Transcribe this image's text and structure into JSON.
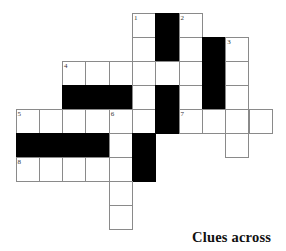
{
  "puzzle": {
    "grid": {
      "origin_x": 15.5,
      "origin_y": 13,
      "cell_w": 23.3,
      "cell_h": 24,
      "cells": [
        {
          "r": 0,
          "c": 5,
          "t": "w",
          "n": "1"
        },
        {
          "r": 0,
          "c": 6,
          "t": "b"
        },
        {
          "r": 0,
          "c": 7,
          "t": "w",
          "n": "2"
        },
        {
          "r": 1,
          "c": 5,
          "t": "w"
        },
        {
          "r": 1,
          "c": 6,
          "t": "b"
        },
        {
          "r": 1,
          "c": 7,
          "t": "w"
        },
        {
          "r": 1,
          "c": 8,
          "t": "b"
        },
        {
          "r": 1,
          "c": 9,
          "t": "w",
          "n": "3"
        },
        {
          "r": 2,
          "c": 2,
          "t": "w",
          "n": "4"
        },
        {
          "r": 2,
          "c": 3,
          "t": "w"
        },
        {
          "r": 2,
          "c": 4,
          "t": "w"
        },
        {
          "r": 2,
          "c": 5,
          "t": "w"
        },
        {
          "r": 2,
          "c": 6,
          "t": "w"
        },
        {
          "r": 2,
          "c": 7,
          "t": "w"
        },
        {
          "r": 2,
          "c": 8,
          "t": "b"
        },
        {
          "r": 2,
          "c": 9,
          "t": "w"
        },
        {
          "r": 3,
          "c": 2,
          "t": "b"
        },
        {
          "r": 3,
          "c": 3,
          "t": "b"
        },
        {
          "r": 3,
          "c": 4,
          "t": "b"
        },
        {
          "r": 3,
          "c": 5,
          "t": "w"
        },
        {
          "r": 3,
          "c": 6,
          "t": "b"
        },
        {
          "r": 3,
          "c": 7,
          "t": "w"
        },
        {
          "r": 3,
          "c": 8,
          "t": "b"
        },
        {
          "r": 3,
          "c": 9,
          "t": "w"
        },
        {
          "r": 4,
          "c": 0,
          "t": "w",
          "n": "5"
        },
        {
          "r": 4,
          "c": 1,
          "t": "w"
        },
        {
          "r": 4,
          "c": 2,
          "t": "w"
        },
        {
          "r": 4,
          "c": 3,
          "t": "w"
        },
        {
          "r": 4,
          "c": 4,
          "t": "w",
          "n": "6"
        },
        {
          "r": 4,
          "c": 5,
          "t": "w"
        },
        {
          "r": 4,
          "c": 6,
          "t": "b"
        },
        {
          "r": 4,
          "c": 7,
          "t": "w",
          "n": "7"
        },
        {
          "r": 4,
          "c": 8,
          "t": "w"
        },
        {
          "r": 4,
          "c": 9,
          "t": "w"
        },
        {
          "r": 4,
          "c": 10,
          "t": "w"
        },
        {
          "r": 5,
          "c": 0,
          "t": "b"
        },
        {
          "r": 5,
          "c": 1,
          "t": "b"
        },
        {
          "r": 5,
          "c": 2,
          "t": "b"
        },
        {
          "r": 5,
          "c": 3,
          "t": "b"
        },
        {
          "r": 5,
          "c": 4,
          "t": "w"
        },
        {
          "r": 5,
          "c": 5,
          "t": "b"
        },
        {
          "r": 5,
          "c": 9,
          "t": "w"
        },
        {
          "r": 6,
          "c": 0,
          "t": "w",
          "n": "8"
        },
        {
          "r": 6,
          "c": 1,
          "t": "w"
        },
        {
          "r": 6,
          "c": 2,
          "t": "w"
        },
        {
          "r": 6,
          "c": 3,
          "t": "w"
        },
        {
          "r": 6,
          "c": 4,
          "t": "w"
        },
        {
          "r": 6,
          "c": 5,
          "t": "b"
        },
        {
          "r": 7,
          "c": 4,
          "t": "w"
        },
        {
          "r": 8,
          "c": 4,
          "t": "w"
        }
      ]
    },
    "clues_heading": "Clues across"
  }
}
